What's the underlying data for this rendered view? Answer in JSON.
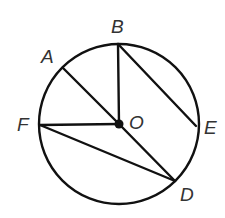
{
  "diagram": {
    "type": "circle-geometry",
    "stroke_color": "#111111",
    "label_color": "#333333",
    "circle": {
      "center": "O",
      "cx": 119,
      "cy": 124,
      "r": 80
    },
    "points": {
      "O": {
        "x": 119,
        "y": 124,
        "label": "O",
        "lx": 129,
        "ly": 129
      },
      "A": {
        "x": 63,
        "y": 68,
        "label": "A",
        "lx": 41,
        "ly": 63
      },
      "B": {
        "x": 118,
        "y": 44,
        "label": "B",
        "lx": 111,
        "ly": 33
      },
      "E": {
        "x": 196,
        "y": 126,
        "label": "E",
        "lx": 204,
        "ly": 134
      },
      "D": {
        "x": 175,
        "y": 181,
        "label": "D",
        "lx": 180,
        "ly": 201
      },
      "F": {
        "x": 40,
        "y": 125,
        "label": "F",
        "lx": 17,
        "ly": 131
      }
    },
    "segments": [
      {
        "from": "A",
        "to": "O",
        "kind": "radius"
      },
      {
        "from": "B",
        "to": "O",
        "kind": "radius"
      },
      {
        "from": "F",
        "to": "O",
        "kind": "radius"
      },
      {
        "from": "O",
        "to": "D",
        "kind": "radius"
      },
      {
        "from": "B",
        "to": "E",
        "kind": "chord"
      },
      {
        "from": "F",
        "to": "D",
        "kind": "chord"
      }
    ],
    "labels": [
      "A",
      "B",
      "O",
      "F",
      "E",
      "D"
    ]
  }
}
